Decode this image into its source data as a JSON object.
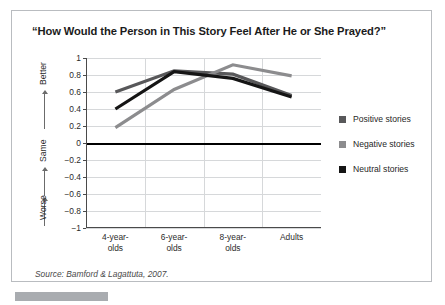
{
  "title": "“How Would the Person in This Story Feel After He or She Prayed?”",
  "source": {
    "prefix": "Source:",
    "text": " Bamford & Lagattuta, 2007."
  },
  "valence_axis": {
    "better": "Better",
    "same": "Same",
    "worse": "Worse"
  },
  "legend": {
    "items": [
      {
        "label": "Positive stories",
        "color": "#58585a"
      },
      {
        "label": "Negative stories",
        "color": "#8c8c8e"
      },
      {
        "label": "Neutral stories",
        "color": "#151515"
      }
    ]
  },
  "chart_data": {
    "type": "line",
    "title": "“How Would the Person in This Story Feel After He or She Prayed?”",
    "xlabel": "",
    "ylabel": "",
    "categories": [
      "4-year-olds",
      "6-year-olds",
      "8-year-olds",
      "Adults"
    ],
    "category_lines": [
      [
        "4-year-",
        "olds"
      ],
      [
        "6-year-",
        "olds"
      ],
      [
        "8-year-",
        "olds"
      ],
      [
        "Adults",
        ""
      ]
    ],
    "ylim": [
      -1,
      1
    ],
    "ytick_values": [
      1,
      0.8,
      0.6,
      0.4,
      0.2,
      0,
      -0.2,
      -0.4,
      -0.6,
      -0.8,
      -1
    ],
    "ytick_labels": [
      "1",
      "0.8",
      "0.6",
      "0.4",
      "0.2",
      "0",
      "−0.2",
      "−0.4",
      "−0.6",
      "−0.8",
      "−1"
    ],
    "grid": true,
    "zero_line": 0,
    "legend_position": "right",
    "series": [
      {
        "name": "Positive stories",
        "color": "#58585a",
        "values": [
          0.6,
          0.85,
          0.81,
          0.56
        ]
      },
      {
        "name": "Negative stories",
        "color": "#8c8c8e",
        "values": [
          0.18,
          0.63,
          0.92,
          0.79
        ]
      },
      {
        "name": "Neutral stories",
        "color": "#151515",
        "values": [
          0.4,
          0.84,
          0.76,
          0.54
        ]
      }
    ]
  }
}
